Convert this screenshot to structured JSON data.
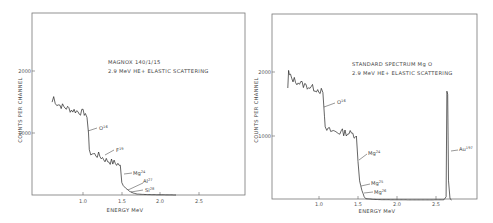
{
  "chart_data": [
    {
      "type": "line",
      "title": "MAGNOX 140/1/15",
      "subtitle": "2.9 MeV HE+ ELASTIC SCATTERING",
      "xlabel": "ENERGY MeV",
      "ylabel": "COUNTS PER CHANNEL",
      "xticks": [
        "1.0",
        "1.5",
        "2.0",
        "2.5"
      ],
      "yticks": [
        "1000",
        "2000"
      ],
      "xlim": [
        0.35,
        3.05
      ],
      "ylim": [
        0,
        2950
      ],
      "x": [
        0.6,
        0.62,
        0.64,
        0.66,
        0.7,
        0.75,
        0.8,
        0.85,
        0.9,
        0.95,
        1.0,
        1.03,
        1.05,
        1.07,
        1.08,
        1.1,
        1.15,
        1.2,
        1.25,
        1.3,
        1.35,
        1.4,
        1.45,
        1.48,
        1.5,
        1.52,
        1.55,
        1.6,
        1.65,
        1.7,
        1.8,
        1.9,
        2.0,
        2.1,
        2.2
      ],
      "series": [
        {
          "name": "spectrum",
          "values": [
            1500,
            1580,
            1520,
            1470,
            1450,
            1420,
            1400,
            1370,
            1360,
            1340,
            1330,
            1320,
            1250,
            1000,
            680,
            680,
            650,
            640,
            600,
            560,
            540,
            520,
            500,
            480,
            200,
            150,
            110,
            60,
            30,
            15,
            8,
            5,
            3,
            2,
            0
          ]
        }
      ],
      "annotations": [
        {
          "text": "O",
          "sup": "16",
          "x": 1.08
        },
        {
          "text": "F",
          "sup": "19",
          "x": 1.3
        },
        {
          "text": "Mg",
          "sup": "24",
          "x": 1.5
        },
        {
          "text": "Al",
          "sup": "27",
          "x": 1.62
        },
        {
          "text": "Si",
          "sup": "28",
          "x": 1.66
        }
      ]
    },
    {
      "type": "line",
      "title": "STANDARD SPECTRUM Mg O",
      "subtitle": "2.9 MeV HE+ ELASTIC SCATTERING",
      "xlabel": "ENERGY MeV",
      "ylabel": "COUNTS PER CHANNEL",
      "xticks": [
        "1.0",
        "1.5",
        "2.0",
        "2.5"
      ],
      "yticks": [
        "1000",
        "2000"
      ],
      "xlim": [
        0.4,
        3.05
      ],
      "ylim": [
        0,
        2900
      ],
      "x": [
        0.6,
        0.61,
        0.62,
        0.65,
        0.7,
        0.75,
        0.8,
        0.85,
        0.9,
        0.95,
        1.0,
        1.03,
        1.05,
        1.07,
        1.08,
        1.1,
        1.15,
        1.2,
        1.25,
        1.3,
        1.35,
        1.4,
        1.45,
        1.48,
        1.5,
        1.52,
        1.55,
        1.58,
        1.6,
        1.7,
        1.8,
        2.0,
        2.2,
        2.4,
        2.6,
        2.63,
        2.64,
        2.65,
        2.66,
        2.68,
        2.7
      ],
      "series": [
        {
          "name": "spectrum",
          "values": [
            1750,
            2000,
            1950,
            1900,
            1860,
            1830,
            1800,
            1780,
            1760,
            1740,
            1720,
            1700,
            1680,
            1300,
            1100,
            1100,
            1080,
            1070,
            1060,
            1060,
            1050,
            1040,
            1020,
            1000,
            600,
            300,
            150,
            50,
            20,
            10,
            5,
            3,
            2,
            2,
            3,
            50,
            1700,
            1650,
            300,
            20,
            0
          ]
        }
      ],
      "annotations": [
        {
          "text": "O",
          "sup": "16",
          "x": 1.08
        },
        {
          "text": "Mg",
          "sup": "24",
          "x": 1.5
        },
        {
          "text": "Mg",
          "sup": "25",
          "x": 1.54
        },
        {
          "text": "Mg",
          "sup": "26",
          "x": 1.57
        },
        {
          "text": "Au",
          "sup": "197",
          "x": 2.66
        }
      ]
    }
  ],
  "left": {
    "title": "MAGNOX 140/1/15",
    "subtitle": "2.9 MeV HE+ ELASTIC SCATTERING",
    "ylabel": "COUNTS PER CHANNEL",
    "xlabel": "ENERGY MeV",
    "ytick_2000": "2000",
    "ytick_1000": "1000",
    "xtick_10": "1.0",
    "xtick_15": "1.5",
    "xtick_20": "2.0",
    "xtick_25": "2.5",
    "ann_o": "O",
    "ann_o_sup": "16",
    "ann_f": "F",
    "ann_f_sup": "19",
    "ann_mg": "Mg",
    "ann_mg_sup": "24",
    "ann_al": "Al",
    "ann_al_sup": "27",
    "ann_si": "Si",
    "ann_si_sup": "28"
  },
  "right": {
    "title": "STANDARD SPECTRUM Mg O",
    "subtitle": "2.9 MeV HE+ ELASTIC SCATTERING",
    "ylabel": "COUNTS PER CHANNEL",
    "xlabel": "ENERGY MeV",
    "ytick_2000": "2000",
    "ytick_1000": "1000",
    "xtick_10": "1.0",
    "xtick_15": "1.5",
    "xtick_20": "2.0",
    "xtick_25": "2.5",
    "ann_o": "O",
    "ann_o_sup": "16",
    "ann_mg24": "Mg",
    "ann_mg24_sup": "24",
    "ann_mg25": "Mg",
    "ann_mg25_sup": "25",
    "ann_mg26": "Mg",
    "ann_mg26_sup": "26",
    "ann_au": "Au",
    "ann_au_sup": "197"
  },
  "colors": {
    "line": "#222222",
    "frame": "#666666",
    "text": "#444444"
  }
}
